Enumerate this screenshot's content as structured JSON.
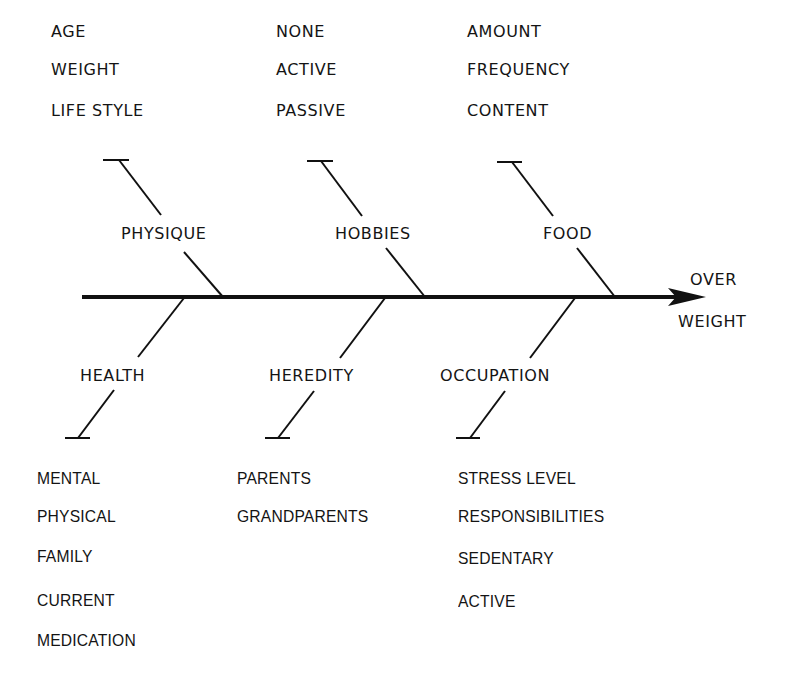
{
  "diagram": {
    "type": "fishbone",
    "effect": {
      "line1": "OVER",
      "line2": "WEIGHT"
    },
    "top_causes": [
      {
        "label": "PHYSIQUE",
        "factors": [
          "AGE",
          "WEIGHT",
          "LIFE STYLE"
        ]
      },
      {
        "label": "HOBBIES",
        "factors": [
          "NONE",
          "ACTIVE",
          "PASSIVE"
        ]
      },
      {
        "label": "FOOD",
        "factors": [
          "AMOUNT",
          "FREQUENCY",
          "CONTENT"
        ]
      }
    ],
    "bottom_causes": [
      {
        "label": "HEALTH",
        "factors": [
          "MENTAL",
          "PHYSICAL",
          "FAMILY",
          "CURRENT",
          "MEDICATION"
        ]
      },
      {
        "label": "HEREDITY",
        "factors": [
          "PARENTS",
          "GRANDPARENTS"
        ]
      },
      {
        "label": "OCCUPATION",
        "factors": [
          "STRESS LEVEL",
          "RESPONSIBILITIES",
          "SEDENTARY",
          "ACTIVE"
        ]
      }
    ],
    "colors": {
      "line": "#111111",
      "text": "#141414",
      "background": "#ffffff"
    }
  }
}
